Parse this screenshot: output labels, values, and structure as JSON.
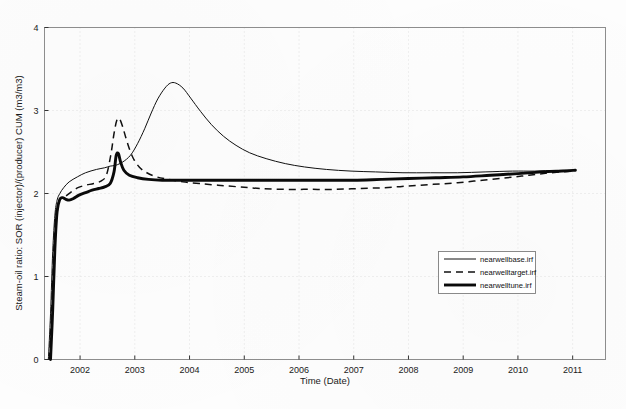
{
  "chart_data": {
    "type": "line",
    "title": "",
    "xlabel": "Time (Date)",
    "ylabel": "Steam-oil ratio: SOR (injector)/(producer) CUM (m3/m3)",
    "xlim": [
      2001.35,
      2011.6
    ],
    "ylim": [
      0,
      4
    ],
    "xticks": [
      2002,
      2003,
      2004,
      2005,
      2006,
      2007,
      2008,
      2009,
      2010,
      2011
    ],
    "xtick_labels": [
      "2002",
      "2003",
      "2004",
      "2005",
      "2006",
      "2007",
      "2008",
      "2009",
      "2010",
      "2011"
    ],
    "yticks": [
      0,
      1,
      2,
      3,
      4
    ],
    "ytick_labels": [
      "0",
      "1",
      "2",
      "3",
      "4"
    ],
    "grid": true,
    "legend_position": "center-right",
    "series": [
      {
        "name": "nearwellbase.irf",
        "style": "solid-thin",
        "color": "#101010",
        "points": [
          [
            2001.42,
            0.0
          ],
          [
            2001.46,
            0.55
          ],
          [
            2001.5,
            1.3
          ],
          [
            2001.54,
            1.74
          ],
          [
            2001.58,
            1.92
          ],
          [
            2001.63,
            2.0
          ],
          [
            2001.7,
            2.07
          ],
          [
            2001.8,
            2.14
          ],
          [
            2001.95,
            2.2
          ],
          [
            2002.1,
            2.25
          ],
          [
            2002.3,
            2.29
          ],
          [
            2002.45,
            2.31
          ],
          [
            2002.55,
            2.33
          ],
          [
            2002.65,
            2.34
          ],
          [
            2002.78,
            2.38
          ],
          [
            2002.92,
            2.46
          ],
          [
            2003.05,
            2.6
          ],
          [
            2003.18,
            2.78
          ],
          [
            2003.3,
            2.97
          ],
          [
            2003.42,
            3.14
          ],
          [
            2003.55,
            3.27
          ],
          [
            2003.65,
            3.33
          ],
          [
            2003.75,
            3.33
          ],
          [
            2003.88,
            3.27
          ],
          [
            2004.02,
            3.15
          ],
          [
            2004.2,
            2.99
          ],
          [
            2004.4,
            2.83
          ],
          [
            2004.62,
            2.69
          ],
          [
            2004.85,
            2.58
          ],
          [
            2005.1,
            2.49
          ],
          [
            2005.4,
            2.42
          ],
          [
            2005.75,
            2.36
          ],
          [
            2006.1,
            2.32
          ],
          [
            2006.5,
            2.29
          ],
          [
            2006.95,
            2.27
          ],
          [
            2007.4,
            2.26
          ],
          [
            2007.9,
            2.25
          ],
          [
            2008.4,
            2.25
          ],
          [
            2008.9,
            2.25
          ],
          [
            2009.4,
            2.26
          ],
          [
            2009.9,
            2.27
          ],
          [
            2010.3,
            2.27
          ],
          [
            2010.7,
            2.28
          ],
          [
            2011.05,
            2.28
          ]
        ]
      },
      {
        "name": "nearwelltarget.irf",
        "style": "dashed",
        "color": "#101010",
        "points": [
          [
            2001.44,
            0.0
          ],
          [
            2001.48,
            0.58
          ],
          [
            2001.52,
            1.32
          ],
          [
            2001.56,
            1.75
          ],
          [
            2001.61,
            1.9
          ],
          [
            2001.66,
            1.94
          ],
          [
            2001.74,
            1.97
          ],
          [
            2001.84,
            2.02
          ],
          [
            2001.96,
            2.07
          ],
          [
            2002.1,
            2.1
          ],
          [
            2002.25,
            2.12
          ],
          [
            2002.38,
            2.15
          ],
          [
            2002.48,
            2.22
          ],
          [
            2002.56,
            2.46
          ],
          [
            2002.62,
            2.72
          ],
          [
            2002.67,
            2.88
          ],
          [
            2002.72,
            2.9
          ],
          [
            2002.78,
            2.8
          ],
          [
            2002.86,
            2.62
          ],
          [
            2002.96,
            2.44
          ],
          [
            2003.08,
            2.32
          ],
          [
            2003.22,
            2.25
          ],
          [
            2003.4,
            2.2
          ],
          [
            2003.62,
            2.17
          ],
          [
            2003.88,
            2.14
          ],
          [
            2004.18,
            2.12
          ],
          [
            2004.52,
            2.1
          ],
          [
            2004.9,
            2.08
          ],
          [
            2005.3,
            2.06
          ],
          [
            2005.75,
            2.05
          ],
          [
            2006.2,
            2.05
          ],
          [
            2006.65,
            2.05
          ],
          [
            2007.1,
            2.06
          ],
          [
            2007.55,
            2.07
          ],
          [
            2008.0,
            2.09
          ],
          [
            2008.45,
            2.11
          ],
          [
            2008.9,
            2.13
          ],
          [
            2009.35,
            2.16
          ],
          [
            2009.8,
            2.19
          ],
          [
            2010.2,
            2.22
          ],
          [
            2010.6,
            2.25
          ],
          [
            2011.0,
            2.27
          ]
        ]
      },
      {
        "name": "nearwelltune.irf",
        "style": "solid-thick",
        "color": "#0a0a0a",
        "points": [
          [
            2001.46,
            0.0
          ],
          [
            2001.5,
            0.6
          ],
          [
            2001.54,
            1.34
          ],
          [
            2001.58,
            1.78
          ],
          [
            2001.63,
            1.93
          ],
          [
            2001.68,
            1.95
          ],
          [
            2001.74,
            1.93
          ],
          [
            2001.8,
            1.92
          ],
          [
            2001.88,
            1.94
          ],
          [
            2001.98,
            1.98
          ],
          [
            2002.1,
            2.01
          ],
          [
            2002.22,
            2.04
          ],
          [
            2002.34,
            2.06
          ],
          [
            2002.45,
            2.08
          ],
          [
            2002.55,
            2.12
          ],
          [
            2002.62,
            2.26
          ],
          [
            2002.66,
            2.46
          ],
          [
            2002.7,
            2.48
          ],
          [
            2002.74,
            2.38
          ],
          [
            2002.8,
            2.28
          ],
          [
            2002.9,
            2.22
          ],
          [
            2003.05,
            2.19
          ],
          [
            2003.25,
            2.17
          ],
          [
            2003.5,
            2.16
          ],
          [
            2003.8,
            2.16
          ],
          [
            2004.15,
            2.16
          ],
          [
            2004.55,
            2.16
          ],
          [
            2005.0,
            2.16
          ],
          [
            2005.5,
            2.16
          ],
          [
            2006.0,
            2.16
          ],
          [
            2006.5,
            2.16
          ],
          [
            2007.0,
            2.16
          ],
          [
            2007.5,
            2.17
          ],
          [
            2008.0,
            2.18
          ],
          [
            2008.5,
            2.19
          ],
          [
            2009.0,
            2.2
          ],
          [
            2009.5,
            2.22
          ],
          [
            2010.0,
            2.24
          ],
          [
            2010.45,
            2.26
          ],
          [
            2010.8,
            2.27
          ],
          [
            2011.05,
            2.28
          ]
        ]
      }
    ],
    "legend_entries": [
      {
        "label": "nearwellbase.irf",
        "style": "solid-thin"
      },
      {
        "label": "nearwelltarget.irf",
        "style": "dashed"
      },
      {
        "label": "nearwelltune.irf",
        "style": "solid-thick"
      }
    ]
  }
}
